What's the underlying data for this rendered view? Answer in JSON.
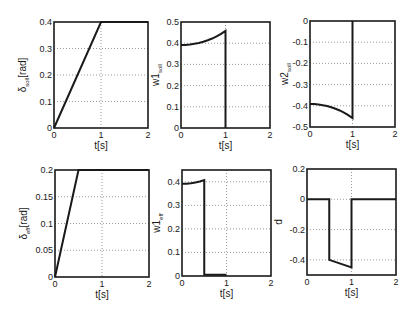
{
  "chart_data": [
    {
      "type": "line",
      "id": "delta-soll",
      "title": "",
      "xlabel": "t[s]",
      "ylabel_main": "δ",
      "ylabel_sub": "soll",
      "ylabel_suffix": "[rad]",
      "xlim": [
        0,
        2
      ],
      "ylim": [
        0,
        0.4
      ],
      "xticks": [
        0,
        1,
        2
      ],
      "yticks": [
        0,
        0.1,
        0.2,
        0.3,
        0.4
      ],
      "ytick_labels": [
        "0",
        "0.1",
        "0.2",
        "0.3",
        "0.4"
      ],
      "grid": true,
      "series": [
        {
          "name": "delta_soll",
          "x": [
            0,
            1,
            2
          ],
          "y": [
            0,
            0.4,
            0.4
          ]
        }
      ]
    },
    {
      "type": "line",
      "id": "w1-soll",
      "title": "",
      "xlabel": "t[s]",
      "ylabel_main": "w1",
      "ylabel_sub": "soll",
      "ylabel_suffix": "",
      "xlim": [
        0,
        2
      ],
      "ylim": [
        0,
        0.5
      ],
      "xticks": [
        0,
        1,
        2
      ],
      "yticks": [
        0,
        0.1,
        0.2,
        0.3,
        0.4,
        0.5
      ],
      "ytick_labels": [
        "0",
        "0.1",
        "0.2",
        "0.3",
        "0.4",
        "0.5"
      ],
      "grid": true,
      "series": [
        {
          "name": "w1_soll",
          "x": [
            0,
            0.1,
            0.2,
            0.3,
            0.4,
            0.5,
            0.6,
            0.7,
            0.8,
            0.9,
            1.0,
            1.0
          ],
          "y": [
            0.392,
            0.392,
            0.394,
            0.397,
            0.401,
            0.407,
            0.414,
            0.422,
            0.432,
            0.444,
            0.458,
            0
          ]
        }
      ]
    },
    {
      "type": "line",
      "id": "w2-soll",
      "title": "",
      "xlabel": "t[s]",
      "ylabel_main": "w2",
      "ylabel_sub": "soll",
      "ylabel_suffix": "",
      "xlim": [
        0,
        2
      ],
      "ylim": [
        -0.5,
        0
      ],
      "xticks": [
        0,
        1,
        2
      ],
      "yticks": [
        -0.5,
        -0.4,
        -0.3,
        -0.2,
        -0.1,
        0
      ],
      "ytick_labels": [
        "-0.5",
        "-0.4",
        "-0.3",
        "-0.2",
        "-0.1",
        "0"
      ],
      "grid": true,
      "series": [
        {
          "name": "w2_soll",
          "x": [
            0,
            0.1,
            0.2,
            0.3,
            0.4,
            0.5,
            0.6,
            0.7,
            0.8,
            0.9,
            1.0,
            1.0
          ],
          "y": [
            -0.392,
            -0.392,
            -0.394,
            -0.397,
            -0.401,
            -0.407,
            -0.414,
            -0.422,
            -0.432,
            -0.444,
            -0.458,
            0
          ]
        }
      ]
    },
    {
      "type": "line",
      "id": "delta-eff",
      "title": "",
      "xlabel": "t[s]",
      "ylabel_main": "δ",
      "ylabel_sub": "eff",
      "ylabel_suffix": "[rad]",
      "xlim": [
        0,
        2
      ],
      "ylim": [
        0,
        0.2
      ],
      "xticks": [
        0,
        1,
        2
      ],
      "yticks": [
        0,
        0.05,
        0.1,
        0.15,
        0.2
      ],
      "ytick_labels": [
        "0",
        "0.05",
        "0.1",
        "0.15",
        "0.2"
      ],
      "grid": true,
      "series": [
        {
          "name": "delta_eff",
          "x": [
            0,
            0.5,
            2
          ],
          "y": [
            0,
            0.2,
            0.2
          ]
        }
      ]
    },
    {
      "type": "line",
      "id": "w1-eff",
      "title": "",
      "xlabel": "t[s]",
      "ylabel_main": "w1",
      "ylabel_sub": "eff",
      "ylabel_suffix": "",
      "xlim": [
        0,
        2
      ],
      "ylim": [
        0,
        0.45
      ],
      "xticks": [
        0,
        1,
        2
      ],
      "yticks": [
        0,
        0.1,
        0.2,
        0.3,
        0.4
      ],
      "ytick_labels": [
        "0",
        "0.1",
        "0.2",
        "0.3",
        "0.4"
      ],
      "grid": true,
      "series": [
        {
          "name": "w1_eff",
          "x": [
            0,
            0.1,
            0.2,
            0.3,
            0.4,
            0.5,
            0.5,
            1.0
          ],
          "y": [
            0.392,
            0.392,
            0.394,
            0.397,
            0.401,
            0.407,
            0.005,
            0.005
          ]
        }
      ]
    },
    {
      "type": "line",
      "id": "d",
      "title": "",
      "xlabel": "t[s]",
      "ylabel_main": "d",
      "ylabel_sub": "",
      "ylabel_suffix": "",
      "xlim": [
        0,
        2
      ],
      "ylim": [
        -0.5,
        0.2
      ],
      "xticks": [
        0,
        1,
        2
      ],
      "yticks": [
        -0.4,
        -0.2,
        0,
        0.2
      ],
      "ytick_labels": [
        "-0.4",
        "-0.2",
        "0",
        "0.2"
      ],
      "grid": true,
      "series": [
        {
          "name": "d",
          "x": [
            0,
            0.5,
            0.5,
            1.0,
            1.0,
            2.0
          ],
          "y": [
            0,
            0,
            -0.4,
            -0.45,
            0,
            0
          ]
        }
      ]
    }
  ]
}
